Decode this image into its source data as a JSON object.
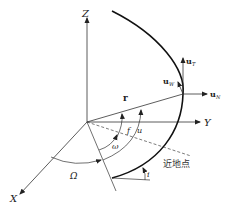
{
  "diagram": {
    "axes": {
      "x": "X",
      "y": "Y",
      "z": "Z"
    },
    "vectors": {
      "r": "r",
      "u_T": "u",
      "u_T_sub": "T",
      "u_W": "u",
      "u_W_sub": "W",
      "u_N": "u",
      "u_N_sub": "N"
    },
    "angles": {
      "f": "f",
      "u": "u",
      "omega": "ω",
      "Omega": "Ω",
      "i": "i"
    },
    "perigee_label": "近地点"
  }
}
